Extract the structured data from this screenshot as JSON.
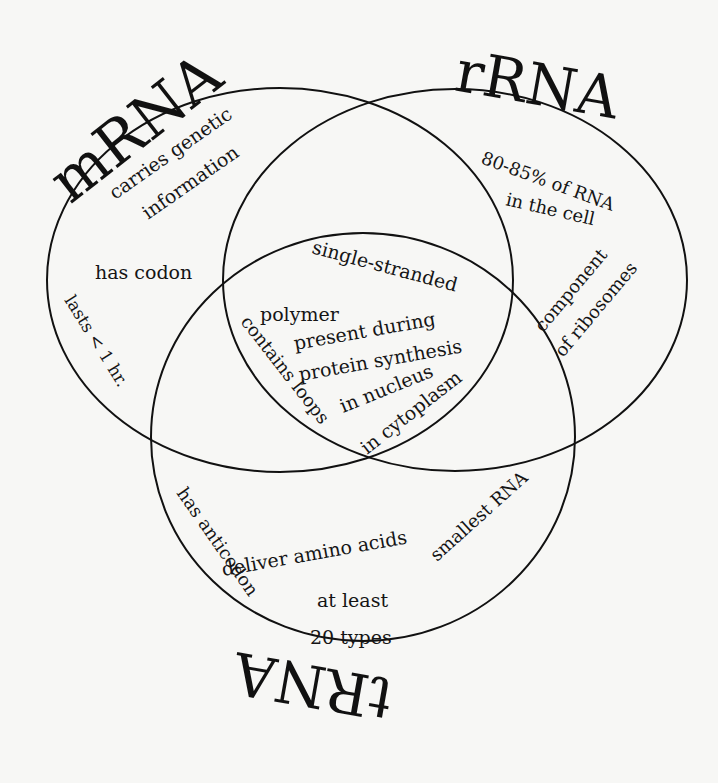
{
  "diagram": {
    "type": "venn",
    "sets": [
      {
        "id": "mrna",
        "label": "mRNA"
      },
      {
        "id": "rrna",
        "label": "rRNA"
      },
      {
        "id": "trna",
        "label": "tRNA"
      }
    ],
    "regions": {
      "mrna_only": [
        "carries genetic",
        "information",
        "has codon",
        "lasts < 1 hr."
      ],
      "rrna_only": [
        "80-85% of RNA",
        "in the cell",
        "component",
        "of ribosomes"
      ],
      "trna_only": [
        "deliver amino acids",
        "at least",
        "20 types",
        "has anticodon",
        "smallest RNA"
      ],
      "all_three": [
        "single-stranded",
        "polymer",
        "present during",
        "protein synthesis",
        "in nucleus",
        "in cytoplasm",
        "contains loops"
      ]
    },
    "colors": {
      "stroke": "#111111",
      "background": "#f7f7f5"
    }
  }
}
